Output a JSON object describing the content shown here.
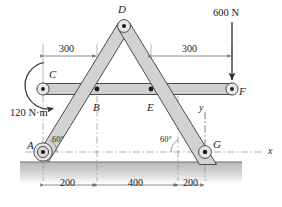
{
  "figure": {
    "joints": [
      {
        "id": "A",
        "label": "A",
        "x": 43,
        "y": 152,
        "type": "pin-support"
      },
      {
        "id": "B",
        "label": "B",
        "x": 97,
        "y": 89,
        "type": "pin"
      },
      {
        "id": "C",
        "label": "C",
        "x": 43,
        "y": 89,
        "type": "pin"
      },
      {
        "id": "D",
        "label": "D",
        "x": 124,
        "y": 26,
        "type": "pin"
      },
      {
        "id": "E",
        "label": "E",
        "x": 151,
        "y": 89,
        "type": "pin"
      },
      {
        "id": "F",
        "label": "F",
        "x": 232,
        "y": 89,
        "type": "pin"
      },
      {
        "id": "G",
        "label": "G",
        "x": 205,
        "y": 152,
        "type": "pin-support"
      }
    ],
    "dimensions_top": [
      {
        "label": "300",
        "from_x": 43,
        "to_x": 97,
        "y": 56
      },
      {
        "label": "300",
        "from_x": 151,
        "to_x": 232,
        "y": 56
      }
    ],
    "dimensions_bottom": [
      {
        "label": "200",
        "from_x": 43,
        "to_x": 97,
        "y": 185
      },
      {
        "label": "400",
        "from_x": 97,
        "to_x": 178,
        "y": 185
      },
      {
        "label": "200",
        "from_x": 178,
        "to_x": 205,
        "y": 185
      }
    ],
    "angles": [
      {
        "label": "60°",
        "x": 56,
        "y": 140
      },
      {
        "label": "60°",
        "x": 165,
        "y": 140
      }
    ],
    "loads": [
      {
        "name": "applied-force",
        "label": "600 N",
        "x": 232,
        "y": 16,
        "direction": "down"
      },
      {
        "name": "applied-couple",
        "label": "120 N·m",
        "x": 14,
        "y": 113,
        "direction": "clockwise"
      }
    ],
    "axes": [
      {
        "label": "x",
        "x": 271,
        "y": 148
      },
      {
        "label": "y",
        "x": 199,
        "y": 107
      }
    ],
    "colors": {
      "member_fill": "#d2d2d2",
      "member_stroke": "#3a3a3a",
      "bar_fill": "#cfcfcf",
      "ink": "#1a1a1a",
      "dim_line": "#7a7a7a",
      "dash_line": "#8a8a8a",
      "ground_line": "#6e6e6e",
      "ground_fill": "#cdcdcd"
    }
  }
}
